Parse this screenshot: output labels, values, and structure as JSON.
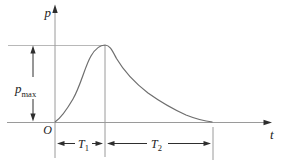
{
  "figure": {
    "background": "#ffffff",
    "colors": {
      "axis": "#9a9a9a",
      "reference_line": "#b8b8b8",
      "curve": "#6e6e6e",
      "dimension": "#2e2e2e",
      "text": "#1c1c1c"
    },
    "axis_labels": {
      "y": "p",
      "x": "t",
      "origin": "O"
    },
    "peak_pressure_label": {
      "base": "p",
      "subscript": "max"
    },
    "rise_duration_label": {
      "base": "T",
      "subscript": "1"
    },
    "decay_duration_label": {
      "base": "T",
      "subscript": "2"
    }
  }
}
